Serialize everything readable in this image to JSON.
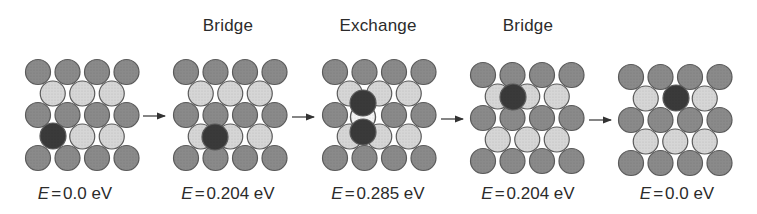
{
  "figure": {
    "colors": {
      "surface_atom": "#8a8a8a",
      "subsurface_atom": "#d6d6d6",
      "adatom": "#3a3a3a",
      "vacancy": "#f4f4f4",
      "outline": "#5a5a5a",
      "arrow": "#333333"
    },
    "panels": [
      {
        "title": "",
        "energy_symbol": "E",
        "energy_eq": "=",
        "energy_value": "0.0 eV",
        "label_x": 75,
        "origin": [
          38,
          72
        ],
        "special": [
          {
            "type": "adatom",
            "x": 53,
            "y": 136
          }
        ],
        "light_rows": {
          "row2": [
            0,
            1,
            2
          ],
          "row4": [
            1,
            2
          ]
        },
        "dark_replaces": {
          "row": 4,
          "index": 0
        }
      },
      {
        "title": "Bridge",
        "energy_symbol": "E",
        "energy_eq": "=",
        "energy_value": "0.204 eV",
        "label_x": 228,
        "origin": [
          186,
          72
        ],
        "special": [
          {
            "type": "adatom",
            "x": 215,
            "y": 137
          }
        ]
      },
      {
        "title": "Exchange",
        "energy_symbol": "E",
        "energy_eq": "=",
        "energy_value": "0.285 eV",
        "label_x": 378,
        "origin": [
          335,
          72
        ],
        "special": [
          {
            "type": "adatom",
            "x": 363,
            "y": 103
          },
          {
            "type": "adatom",
            "x": 363,
            "y": 132
          },
          {
            "type": "vacancy",
            "x": 363,
            "y": 117
          }
        ]
      },
      {
        "title": "Bridge",
        "energy_symbol": "E",
        "energy_eq": "=",
        "energy_value": "0.204 eV",
        "label_x": 528,
        "origin": [
          483,
          75
        ],
        "special": [
          {
            "type": "adatom",
            "x": 513,
            "y": 97
          }
        ]
      },
      {
        "title": "",
        "energy_symbol": "E",
        "energy_eq": "=",
        "energy_value": "0.0 eV",
        "label_x": 677,
        "origin": [
          631,
          77
        ],
        "special": [
          {
            "type": "adatom",
            "x": 676,
            "y": 98
          }
        ]
      }
    ],
    "arrows": [
      {
        "x1": 143,
        "x2": 165,
        "y": 116
      },
      {
        "x1": 292,
        "x2": 314,
        "y": 117
      },
      {
        "x1": 441,
        "x2": 463,
        "y": 119
      },
      {
        "x1": 589,
        "x2": 611,
        "y": 120
      }
    ],
    "lattice": {
      "pitch_x": 29.5,
      "pitch_y": 21.5,
      "radius": 12.5,
      "rows": 5
    }
  }
}
